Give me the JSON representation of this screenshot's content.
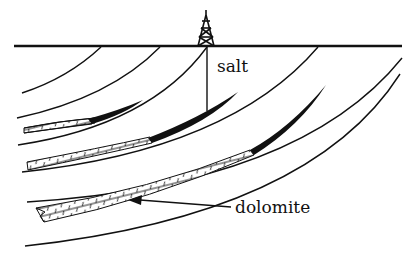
{
  "diagram": {
    "type": "geologic cross-section",
    "labels": {
      "salt": "salt",
      "dolomite": "dolomite"
    },
    "elements": [
      {
        "name": "ground-surface",
        "description": "horizontal surface line"
      },
      {
        "name": "drilling-derrick",
        "description": "oil derrick icon on surface"
      },
      {
        "name": "well-bore",
        "description": "vertical well line from derrick to salt layer"
      },
      {
        "name": "curved-strata",
        "description": "arcuate bedding layers dipping down-left"
      },
      {
        "name": "salt-lenses",
        "description": "black tapered salt lenses"
      },
      {
        "name": "dolomite-beds",
        "description": "brick-patterned dolomite beds"
      }
    ],
    "colors": {
      "line": "#111111",
      "background": "#ffffff"
    }
  }
}
